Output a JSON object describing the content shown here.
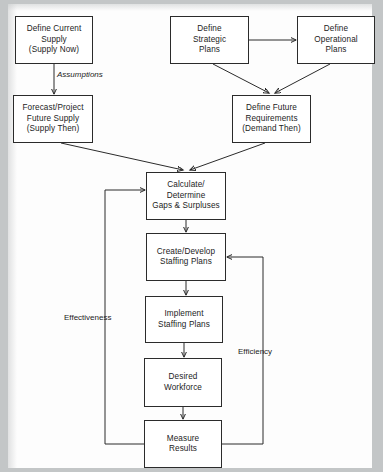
{
  "diagram": {
    "background_color": "#c3c6c7",
    "sheet_color": "#fdfdfd",
    "line_color": "#2b2b2b",
    "node_fill": "#ffffff"
  },
  "nodes": [
    {
      "id": "define-current-supply",
      "label": "Define Current\nSupply\n(Supply Now)",
      "x": 15,
      "y": 16,
      "w": 78,
      "h": 48
    },
    {
      "id": "forecast-future-supply",
      "label": "Forecast/Project\nFuture Supply\n(Supply Then)",
      "x": 13,
      "y": 95,
      "w": 80,
      "h": 48
    },
    {
      "id": "define-strategic-plans",
      "label": "Define\nStrategic\nPlans",
      "x": 170,
      "y": 16,
      "w": 79,
      "h": 48
    },
    {
      "id": "define-operational-plans",
      "label": "Define\nOperational\nPlans",
      "x": 297,
      "y": 16,
      "w": 78,
      "h": 48
    },
    {
      "id": "define-future-requirements",
      "label": "Define Future\nRequirements\n(Demand Then)",
      "x": 232,
      "y": 95,
      "w": 79,
      "h": 48
    },
    {
      "id": "calculate-gaps-surpluses",
      "label": "Calculate/\nDetermine\nGaps & Surpluses",
      "x": 146,
      "y": 172,
      "w": 80,
      "h": 48
    },
    {
      "id": "create-develop-staffing",
      "label": "Create/Develop\nStaffing Plans",
      "x": 146,
      "y": 233,
      "w": 80,
      "h": 48
    },
    {
      "id": "implement-staffing-plans",
      "label": "Implement\nStaffing Plans",
      "x": 145,
      "y": 296,
      "w": 78,
      "h": 47
    },
    {
      "id": "desired-workforce",
      "label": "Desired\nWorkforce",
      "x": 144,
      "y": 358,
      "w": 78,
      "h": 49
    },
    {
      "id": "measure-results",
      "label": "Measure\nResults",
      "x": 144,
      "y": 420,
      "w": 78,
      "h": 48
    }
  ],
  "edge_labels": [
    {
      "id": "assumptions",
      "text": "Assumptions",
      "x": 57,
      "y": 70,
      "italic": true
    },
    {
      "id": "effectiveness",
      "text": "Effectiveness",
      "x": 64,
      "y": 313,
      "italic": false
    },
    {
      "id": "efficiency",
      "text": "Efficiency",
      "x": 238,
      "y": 347,
      "italic": false
    }
  ],
  "edges": [
    {
      "from": "define-current-supply",
      "to": "forecast-future-supply",
      "kind": "vertical-arrow"
    },
    {
      "from": "define-strategic-plans",
      "to": "define-operational-plans",
      "kind": "horizontal-arrow"
    },
    {
      "from": "define-strategic-plans",
      "to": "define-future-requirements",
      "kind": "diagonal-arrow"
    },
    {
      "from": "define-operational-plans",
      "to": "define-future-requirements",
      "kind": "diagonal-arrow"
    },
    {
      "from": "forecast-future-supply",
      "to": "calculate-gaps-surpluses",
      "kind": "diagonal-arrow"
    },
    {
      "from": "define-future-requirements",
      "to": "calculate-gaps-surpluses",
      "kind": "diagonal-arrow"
    },
    {
      "from": "calculate-gaps-surpluses",
      "to": "create-develop-staffing",
      "kind": "vertical-arrow"
    },
    {
      "from": "create-develop-staffing",
      "to": "implement-staffing-plans",
      "kind": "vertical-arrow"
    },
    {
      "from": "implement-staffing-plans",
      "to": "desired-workforce",
      "kind": "vertical-arrow"
    },
    {
      "from": "desired-workforce",
      "to": "measure-results",
      "kind": "vertical-arrow"
    },
    {
      "from": "measure-results",
      "to": "calculate-gaps-surpluses",
      "kind": "feedback-left",
      "label": "Effectiveness"
    },
    {
      "from": "measure-results",
      "to": "create-develop-staffing",
      "kind": "feedback-right",
      "label": "Efficiency"
    }
  ]
}
